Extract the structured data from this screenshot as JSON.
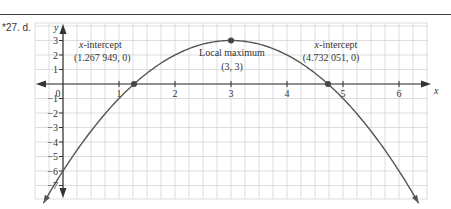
{
  "problem_label": "*27. d.",
  "chart_data": {
    "type": "line",
    "title": "",
    "function_shape": "downward parabola through (0,-6), vertex (3,3)",
    "xlabel": "x",
    "ylabel": "y",
    "xlim": [
      -0.5,
      6.5
    ],
    "ylim": [
      -7.9,
      4.2
    ],
    "x_ticks": [
      "0",
      "1",
      "2",
      "3",
      "4",
      "5",
      "6"
    ],
    "y_ticks": [
      "3",
      "2",
      "1",
      "−1",
      "−2",
      "−3",
      "−4",
      "−5",
      "−6",
      "−7"
    ],
    "grid": true,
    "series": [
      {
        "name": "curve",
        "x": [
          -0.35,
          0,
          0.5,
          1,
          1.267949,
          1.5,
          2,
          2.5,
          3,
          3.5,
          4,
          4.5,
          4.732051,
          5,
          5.5,
          6,
          6.35
        ],
        "y": [
          -7.22,
          -6,
          -3.75,
          -1,
          0,
          0.75,
          2,
          2.75,
          3,
          2.75,
          2,
          0.75,
          0,
          -1,
          -3.75,
          -6,
          -7.22
        ]
      }
    ],
    "points": [
      {
        "x": 1.267949,
        "y": 0,
        "label": "x-intercept",
        "coords": "(1.267 949, 0)"
      },
      {
        "x": 3,
        "y": 3,
        "label": "Local maximum",
        "coords": "(3, 3)"
      },
      {
        "x": 4.732051,
        "y": 0,
        "label": "x-intercept",
        "coords": "(4.732 051, 0)"
      }
    ],
    "annotations": {
      "left_intercept": {
        "title_italic": "x",
        "title_rest": "-intercept",
        "coords": "(1.267 949, 0)"
      },
      "maximum": {
        "title": "Local maximum",
        "coords": "(3, 3)"
      },
      "right_intercept": {
        "title_italic": "x",
        "title_rest": "-intercept",
        "coords": "(4.732 051, 0)"
      }
    }
  },
  "colors": {
    "curve": "#555555",
    "grid": "#d4d4d4",
    "axis": "#333333",
    "point": "#444444"
  }
}
